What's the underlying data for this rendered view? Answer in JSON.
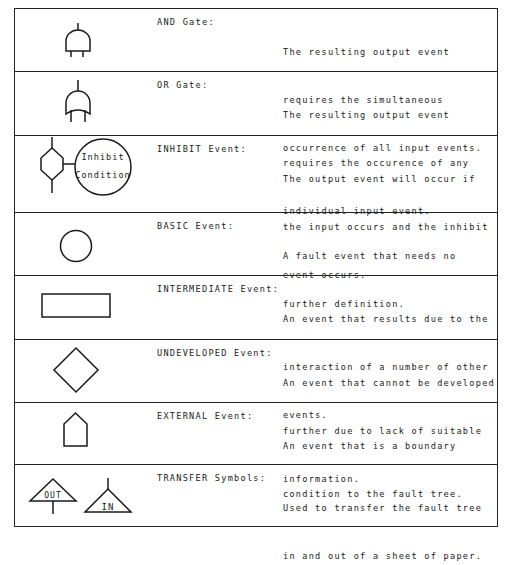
{
  "rows": [
    {
      "symbol": "and-gate-icon",
      "label": "AND Gate:",
      "description": [
        "The resulting output event",
        "requires the simultaneous",
        "occurrence of all input events."
      ]
    },
    {
      "symbol": "or-gate-icon",
      "label": "OR Gate:",
      "description": [
        "The resulting output event",
        "requires the occurence of any",
        "individual input event."
      ]
    },
    {
      "symbol": "inhibit-event-icon",
      "symbol_text": [
        "Inhibit",
        "Condition"
      ],
      "label": "INHIBIT Event:",
      "description": [
        "The output event will occur if",
        "the input occurs and the inhibit",
        "event occurs."
      ]
    },
    {
      "symbol": "basic-event-icon",
      "label": "BASIC Event:",
      "description": [
        "A fault event that needs no",
        "further definition."
      ]
    },
    {
      "symbol": "intermediate-event-icon",
      "label": "INTERMEDIATE Event:",
      "description": [
        "An event that results due to the",
        "interaction of a number of other",
        "events."
      ]
    },
    {
      "symbol": "undeveloped-event-icon",
      "label": "UNDEVELOPED Event:",
      "description": [
        "An event that cannot be developed",
        "further due to lack of suitable",
        "information."
      ]
    },
    {
      "symbol": "external-event-icon",
      "label": "EXTERNAL Event:",
      "description": [
        "An event that is a boundary",
        "condition to the fault tree."
      ]
    },
    {
      "symbol": "transfer-symbols-icon",
      "symbol_text": [
        "OUT",
        "IN"
      ],
      "label": "TRANSFER Symbols:",
      "description": [
        "Used to transfer the fault tree",
        "in and out of a sheet of paper."
      ]
    }
  ],
  "colors": {
    "line": "#1a1a1a",
    "background": "#ffffff"
  }
}
